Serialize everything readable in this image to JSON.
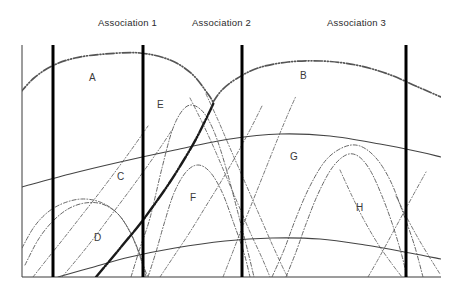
{
  "figure": {
    "title": "",
    "background": "#ffffff",
    "frame_color": "#3a3a3a",
    "divider_color": "#000000",
    "solid_curve_color": "#444444",
    "dashdot_curve_color": "#555555",
    "thick_dashdot_color": "#1a1a1a"
  },
  "headers": [
    {
      "label": "Association 1",
      "x": 98,
      "y": 17
    },
    {
      "label": "Association 2",
      "x": 192,
      "y": 17
    },
    {
      "label": "Association 3",
      "x": 327,
      "y": 17
    }
  ],
  "region_labels": [
    {
      "id": "A",
      "label": "A",
      "x": 89,
      "y": 72
    },
    {
      "id": "B",
      "label": "B",
      "x": 300,
      "y": 70
    },
    {
      "id": "C",
      "label": "C",
      "x": 117,
      "y": 171
    },
    {
      "id": "D",
      "label": "D",
      "x": 94,
      "y": 232
    },
    {
      "id": "E",
      "label": "E",
      "x": 157,
      "y": 99
    },
    {
      "id": "F",
      "label": "F",
      "x": 190,
      "y": 192
    },
    {
      "id": "G",
      "label": "G",
      "x": 290,
      "y": 151
    },
    {
      "id": "H",
      "label": "H",
      "x": 356,
      "y": 202
    }
  ],
  "chart_data": {
    "type": "line",
    "title": "",
    "xlabel": "",
    "ylabel": "",
    "grid": false,
    "legend": "none",
    "xlim": [
      22,
      441
    ],
    "ylim": [
      45,
      277
    ],
    "frame": {
      "left": 22,
      "right": 441,
      "top": 45,
      "bottom": 277
    },
    "dividers": [
      {
        "name": "divider-1",
        "x": 53,
        "y_top": 45,
        "y_bottom": 277,
        "width": 3
      },
      {
        "name": "divider-2",
        "x": 143,
        "y_top": 45,
        "y_bottom": 277,
        "width": 3
      },
      {
        "name": "divider-3",
        "x": 242,
        "y_top": 45,
        "y_bottom": 277,
        "width": 3
      },
      {
        "name": "divider-4",
        "x": 406,
        "y_top": 45,
        "y_bottom": 277,
        "width": 3
      }
    ],
    "series": [
      {
        "name": "curve-A",
        "style": "dash-dot-dot",
        "weight": 1.7,
        "points": [
          [
            20,
            93
          ],
          [
            34,
            78
          ],
          [
            52,
            66
          ],
          [
            75,
            58
          ],
          [
            105,
            54
          ],
          [
            140,
            53
          ],
          [
            170,
            60
          ],
          [
            192,
            74
          ],
          [
            208,
            94
          ],
          [
            213,
            102
          ]
        ]
      },
      {
        "name": "curve-B",
        "style": "dash-dot-dot",
        "weight": 1.7,
        "points": [
          [
            213,
            102
          ],
          [
            222,
            90
          ],
          [
            236,
            79
          ],
          [
            258,
            68
          ],
          [
            288,
            62
          ],
          [
            322,
            61
          ],
          [
            356,
            65
          ],
          [
            388,
            74
          ],
          [
            418,
            87
          ],
          [
            441,
            97
          ]
        ]
      },
      {
        "name": "curve-G-upper-boundary",
        "style": "solid",
        "weight": 1.1,
        "points": [
          [
            22,
            187
          ],
          [
            70,
            174
          ],
          [
            120,
            162
          ],
          [
            175,
            150
          ],
          [
            230,
            139
          ],
          [
            280,
            134
          ],
          [
            330,
            136
          ],
          [
            380,
            144
          ],
          [
            420,
            152
          ],
          [
            441,
            157
          ]
        ]
      },
      {
        "name": "curve-lower-boundary",
        "style": "solid",
        "weight": 1.1,
        "points": [
          [
            58,
            277
          ],
          [
            90,
            268
          ],
          [
            130,
            257
          ],
          [
            175,
            248
          ],
          [
            225,
            241
          ],
          [
            272,
            238
          ],
          [
            320,
            239
          ],
          [
            365,
            245
          ],
          [
            410,
            253
          ],
          [
            441,
            259
          ]
        ]
      },
      {
        "name": "curve-D-outer",
        "style": "dash-dot",
        "weight": 0.9,
        "points": [
          [
            25,
            265
          ],
          [
            38,
            240
          ],
          [
            52,
            222
          ],
          [
            68,
            209
          ],
          [
            85,
            203
          ],
          [
            102,
            204
          ],
          [
            118,
            214
          ],
          [
            130,
            232
          ],
          [
            139,
            252
          ],
          [
            145,
            270
          ],
          [
            148,
            277
          ]
        ]
      },
      {
        "name": "curve-D-inner",
        "style": "dash-dot",
        "weight": 0.9,
        "points": [
          [
            22,
            248
          ],
          [
            34,
            227
          ],
          [
            48,
            212
          ],
          [
            64,
            203
          ],
          [
            82,
            199
          ],
          [
            100,
            202
          ],
          [
            116,
            212
          ],
          [
            128,
            228
          ],
          [
            137,
            248
          ],
          [
            143,
            266
          ],
          [
            146,
            277
          ]
        ]
      },
      {
        "name": "curve-E",
        "style": "dash-dot",
        "weight": 0.9,
        "points": [
          [
            131,
            277
          ],
          [
            140,
            248
          ],
          [
            150,
            218
          ],
          [
            162,
            168
          ],
          [
            172,
            131
          ],
          [
            182,
            111
          ],
          [
            192,
            105
          ],
          [
            204,
            113
          ],
          [
            215,
            134
          ],
          [
            226,
            168
          ],
          [
            238,
            213
          ],
          [
            248,
            252
          ],
          [
            254,
            277
          ]
        ]
      },
      {
        "name": "curve-F",
        "style": "dash-dot",
        "weight": 0.9,
        "points": [
          [
            148,
            277
          ],
          [
            156,
            252
          ],
          [
            164,
            224
          ],
          [
            174,
            193
          ],
          [
            186,
            172
          ],
          [
            198,
            165
          ],
          [
            210,
            172
          ],
          [
            222,
            192
          ],
          [
            234,
            224
          ],
          [
            244,
            253
          ],
          [
            250,
            277
          ]
        ]
      },
      {
        "name": "curve-H-outer",
        "style": "dash-dot",
        "weight": 0.9,
        "points": [
          [
            272,
            277
          ],
          [
            284,
            250
          ],
          [
            296,
            218
          ],
          [
            310,
            186
          ],
          [
            326,
            160
          ],
          [
            344,
            147
          ],
          [
            360,
            146
          ],
          [
            376,
            158
          ],
          [
            390,
            180
          ],
          [
            402,
            210
          ],
          [
            414,
            244
          ],
          [
            423,
            277
          ]
        ]
      },
      {
        "name": "curve-H-inner",
        "style": "dash-dot",
        "weight": 0.9,
        "points": [
          [
            286,
            277
          ],
          [
            296,
            252
          ],
          [
            306,
            224
          ],
          [
            318,
            194
          ],
          [
            332,
            168
          ],
          [
            346,
            155
          ],
          [
            358,
            156
          ],
          [
            370,
            170
          ],
          [
            382,
            196
          ],
          [
            393,
            226
          ],
          [
            402,
            256
          ],
          [
            407,
            277
          ]
        ]
      },
      {
        "name": "curve-thick-diagonal",
        "style": "dash-dot-dot",
        "weight": 2.4,
        "points": [
          [
            96,
            277
          ],
          [
            112,
            258
          ],
          [
            126,
            241
          ],
          [
            140,
            224
          ],
          [
            154,
            205
          ],
          [
            168,
            185
          ],
          [
            182,
            163
          ],
          [
            196,
            139
          ],
          [
            208,
            115
          ],
          [
            214,
            102
          ]
        ]
      },
      {
        "name": "curve-thin-rise-right",
        "style": "dash-dot",
        "weight": 0.8,
        "points": [
          [
            223,
            277
          ],
          [
            232,
            254
          ],
          [
            242,
            228
          ],
          [
            254,
            198
          ],
          [
            266,
            168
          ],
          [
            278,
            138
          ],
          [
            288,
            114
          ],
          [
            296,
            96
          ]
        ]
      },
      {
        "name": "curve-thin-fall-left",
        "style": "dash-dot",
        "weight": 0.8,
        "points": [
          [
            33,
            277
          ],
          [
            48,
            258
          ],
          [
            64,
            238
          ],
          [
            82,
            215
          ],
          [
            100,
            192
          ],
          [
            118,
            168
          ],
          [
            134,
            146
          ],
          [
            148,
            126
          ]
        ]
      },
      {
        "name": "curve-thin-fall-mid",
        "style": "dash-dot",
        "weight": 0.8,
        "points": [
          [
            62,
            277
          ],
          [
            78,
            258
          ],
          [
            94,
            238
          ],
          [
            112,
            214
          ],
          [
            130,
            190
          ],
          [
            146,
            168
          ],
          [
            160,
            148
          ],
          [
            172,
            130
          ]
        ]
      },
      {
        "name": "curve-thin-rise-a",
        "style": "dash-dot",
        "weight": 0.8,
        "points": [
          [
            160,
            277
          ],
          [
            174,
            256
          ],
          [
            190,
            232
          ],
          [
            206,
            206
          ],
          [
            222,
            180
          ],
          [
            238,
            152
          ],
          [
            252,
            126
          ],
          [
            262,
            106
          ]
        ]
      },
      {
        "name": "curve-thin-fall-a",
        "style": "dash-dot",
        "weight": 0.8,
        "points": [
          [
            190,
            98
          ],
          [
            202,
            122
          ],
          [
            214,
            148
          ],
          [
            226,
            176
          ],
          [
            238,
            204
          ],
          [
            250,
            232
          ],
          [
            262,
            258
          ],
          [
            270,
            277
          ]
        ]
      },
      {
        "name": "curve-thin-fall-b",
        "style": "dash-dot",
        "weight": 0.8,
        "points": [
          [
            206,
            94
          ],
          [
            218,
            120
          ],
          [
            230,
            148
          ],
          [
            244,
            180
          ],
          [
            258,
            212
          ],
          [
            272,
            244
          ],
          [
            284,
            270
          ],
          [
            288,
            277
          ]
        ]
      },
      {
        "name": "curve-thin-fall-c",
        "style": "dash-dot",
        "weight": 0.8,
        "points": [
          [
            340,
            170
          ],
          [
            352,
            196
          ],
          [
            364,
            220
          ],
          [
            378,
            244
          ],
          [
            392,
            264
          ],
          [
            402,
            277
          ]
        ]
      },
      {
        "name": "curve-thin-fall-d",
        "style": "dash-dot",
        "weight": 0.8,
        "points": [
          [
            396,
            196
          ],
          [
            406,
            216
          ],
          [
            418,
            238
          ],
          [
            430,
            258
          ],
          [
            440,
            274
          ]
        ]
      },
      {
        "name": "curve-thin-rise-b",
        "style": "dash-dot",
        "weight": 0.8,
        "points": [
          [
            368,
            277
          ],
          [
            380,
            256
          ],
          [
            392,
            234
          ],
          [
            404,
            212
          ],
          [
            416,
            190
          ],
          [
            426,
            172
          ]
        ]
      }
    ]
  }
}
